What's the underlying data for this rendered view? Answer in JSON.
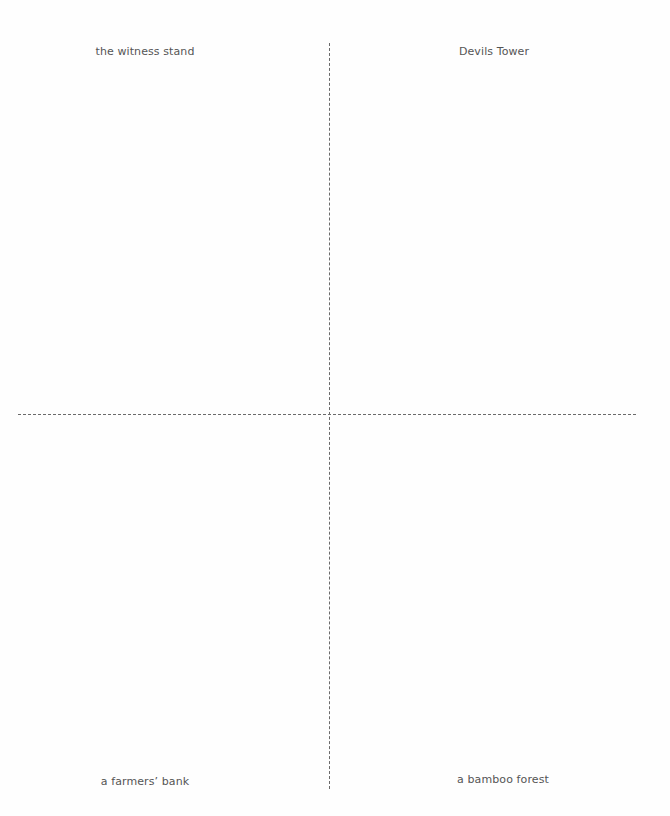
{
  "quadrants": {
    "top_left": "the witness stand",
    "top_right": "Devils Tower",
    "bottom_left": "a farmers’ bank",
    "bottom_right": "a bamboo forest"
  },
  "colors": {
    "text": "#555555",
    "divider": "#6a6a6a",
    "background": "#ffffff"
  }
}
